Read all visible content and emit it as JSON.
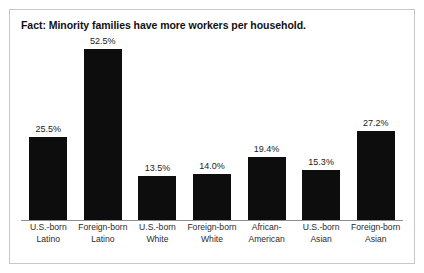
{
  "figure": {
    "clipped_caption": "",
    "title": "Fact: Minority families have more workers per household.",
    "border_color": "#c8c8c8",
    "bar_color": "#0d0d0d",
    "axis_color": "#8f8f8f"
  },
  "chart_data": {
    "type": "bar",
    "title": "Fact: Minority families have more workers per household.",
    "xlabel": "",
    "ylabel": "",
    "ylim": [
      0,
      57
    ],
    "grid": false,
    "legend": null,
    "value_format": "percent",
    "categories": [
      "U.S.-born Latino",
      "Foreign-born Latino",
      "U.S.-born White",
      "Foreign-born White",
      "African-American",
      "U.S.-born Asian",
      "Foreign-born Asian"
    ],
    "category_lines": [
      [
        "U.S.-born",
        "Latino"
      ],
      [
        "Foreign-born",
        "Latino"
      ],
      [
        "U.S.-born",
        "White"
      ],
      [
        "Foreign-born",
        "White"
      ],
      [
        "African-",
        "American"
      ],
      [
        "U.S.-born",
        "Asian"
      ],
      [
        "Foreign-born",
        "Asian"
      ]
    ],
    "values": [
      25.5,
      52.5,
      13.5,
      14.0,
      19.4,
      15.3,
      27.2
    ],
    "value_labels": [
      "25.5%",
      "52.5%",
      "13.5%",
      "14.0%",
      "19.4%",
      "15.3%",
      "27.2%"
    ]
  }
}
